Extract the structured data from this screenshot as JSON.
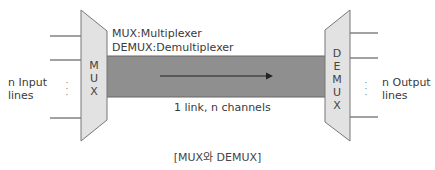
{
  "diagram": {
    "legend": {
      "mux_definition": "MUX:Multiplexer",
      "demux_definition": "DEMUX:Demultiplexer"
    },
    "mux": {
      "letters": [
        "M",
        "U",
        "X"
      ],
      "input_label_line1": "n Input",
      "input_label_line2": "lines",
      "ellipsis": "·\n·\n·"
    },
    "demux": {
      "letters": [
        "D",
        "E",
        "M",
        "U",
        "X"
      ],
      "output_label_line1": "n Output",
      "output_label_line2": "lines",
      "ellipsis": "·\n·\n·"
    },
    "link": {
      "label": "1 link, n channels"
    },
    "caption": "[MUX와 DEMUX]",
    "colors": {
      "device_fill": "#e2e2e2",
      "device_stroke": "#777777",
      "link_fill": "#8f8f8f",
      "line": "#444444"
    }
  }
}
